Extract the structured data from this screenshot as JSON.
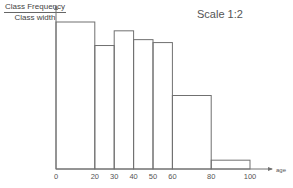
{
  "chart_data": {
    "type": "bar",
    "subtype": "histogram",
    "title": "",
    "annotation": "Scale 1:2",
    "xlabel": "age",
    "ylabel": {
      "numerator": "Class Frequency",
      "denominator": "Class width"
    },
    "y_axis_note": "No y-axis ticks or values are shown; bar heights are relative only.",
    "x_ticks": [
      0,
      20,
      30,
      40,
      50,
      60,
      80,
      100
    ],
    "xlim": [
      0,
      110
    ],
    "grid": false,
    "legend": null,
    "bins": [
      {
        "from": 0,
        "to": 20
      },
      {
        "from": 20,
        "to": 30
      },
      {
        "from": 30,
        "to": 40
      },
      {
        "from": 40,
        "to": 50
      },
      {
        "from": 50,
        "to": 60
      },
      {
        "from": 60,
        "to": 80
      },
      {
        "from": 80,
        "to": 100
      }
    ],
    "relative_heights": [
      1.0,
      0.84,
      0.94,
      0.88,
      0.86,
      0.5,
      0.06
    ],
    "measured_pixel_heights": [
      147,
      123,
      138,
      129,
      126,
      73,
      9
    ],
    "categories": [
      "0-20",
      "20-30",
      "30-40",
      "40-50",
      "50-60",
      "60-80",
      "80-100"
    ]
  },
  "labels": {
    "scale": "Scale 1:2",
    "ylabel_num": "Class Frequency",
    "ylabel_den": "Class width"
  },
  "colors": {
    "line": "#707070",
    "text": "#555555"
  }
}
